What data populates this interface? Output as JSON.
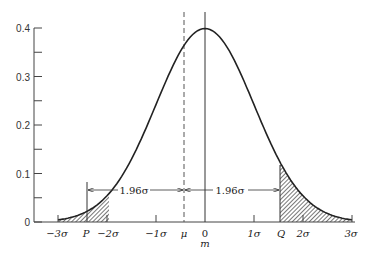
{
  "chart_data": {
    "type": "area",
    "title": "",
    "xlabel": "",
    "ylabel": "",
    "ylim": [
      0,
      0.4
    ],
    "xlim": [
      -3,
      3
    ],
    "grid": false,
    "y_ticks": [
      "0",
      "0.1",
      "0.2",
      "0.3",
      "0.4"
    ],
    "y_tick_values": [
      0,
      0.1,
      0.2,
      0.3,
      0.4
    ],
    "y_minor_ticks": [
      0.05,
      0.15,
      0.25,
      0.35
    ],
    "x_ticks": [
      {
        "label": "−3σ",
        "value": -3
      },
      {
        "label": "P",
        "value": -1.96
      },
      {
        "label": "−2σ",
        "value": -2
      },
      {
        "label": "−1σ",
        "value": -1
      },
      {
        "label": "μ",
        "value": -0.43
      },
      {
        "label": "0",
        "sublabel": "m",
        "value": 0
      },
      {
        "label": "1σ",
        "value": 1
      },
      {
        "label": "Q",
        "value": 1.53
      },
      {
        "label": "2σ",
        "value": 2
      },
      {
        "label": "3σ",
        "value": 3
      }
    ],
    "series": [
      {
        "name": "normal density",
        "center": 0,
        "sigma": 1,
        "peak": 0.399,
        "x": [
          -3,
          -2.5,
          -2,
          -1.5,
          -1,
          -0.5,
          0,
          0.5,
          1,
          1.5,
          2,
          2.5,
          3
        ],
        "y": [
          0.004,
          0.018,
          0.054,
          0.13,
          0.242,
          0.352,
          0.399,
          0.352,
          0.242,
          0.13,
          0.054,
          0.018,
          0.004
        ]
      }
    ],
    "shaded_regions": [
      {
        "name": "left tail",
        "from": -3,
        "to": -1.96,
        "pattern": "hatched"
      },
      {
        "name": "right tail",
        "from": 1.53,
        "to": 3,
        "pattern": "hatched"
      }
    ],
    "vertical_lines": [
      {
        "name": "mu",
        "x": -0.43,
        "style": "dashed"
      },
      {
        "name": "m",
        "x": 0,
        "style": "solid"
      }
    ],
    "annotations": [
      {
        "text": "1.96σ",
        "from": "P",
        "to": "μ",
        "type": "double-arrow"
      },
      {
        "text": "1.96σ",
        "from": "μ",
        "to": "Q",
        "type": "double-arrow"
      }
    ]
  },
  "labels": {
    "y0": "0",
    "y1": "0.1",
    "y2": "0.2",
    "y3": "0.3",
    "y4": "0.4",
    "xm3": "−3σ",
    "xP": "P",
    "xm2": "−2σ",
    "xm1": "−1σ",
    "xmu": "μ",
    "x0": "0",
    "xm": "m",
    "x1": "1σ",
    "xQ": "Q",
    "x2": "2σ",
    "x3": "3σ",
    "left_span": "1.96σ",
    "right_span": "1.96σ"
  },
  "colors": {
    "ink": "#222222",
    "hatch": "#555555",
    "axis": "#444444"
  }
}
